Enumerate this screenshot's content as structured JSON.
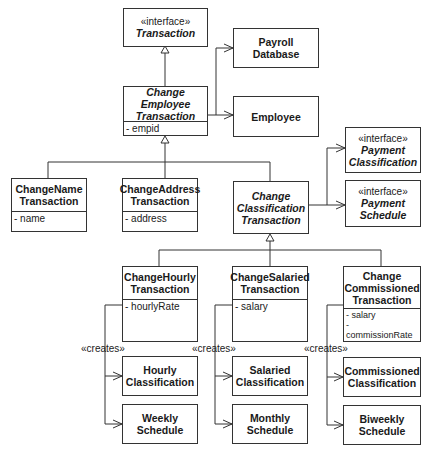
{
  "diagram": {
    "type": "UML class diagram",
    "classes": {
      "transaction": {
        "stereotype": "«interface»",
        "name": "Transaction"
      },
      "change_employee": {
        "line1": "Change",
        "line2": "Employee",
        "line3": "Transaction",
        "attrs": [
          "- empid"
        ]
      },
      "payroll_database": {
        "line1": "Payroll",
        "line2": "Database"
      },
      "employee": {
        "line1": "Employee"
      },
      "change_name": {
        "line1": "ChangeName",
        "line2": "Transaction",
        "attrs": [
          "- name"
        ]
      },
      "change_address": {
        "line1": "ChangeAddress",
        "line2": "Transaction",
        "attrs": [
          "- address"
        ]
      },
      "change_classification": {
        "line1": "Change",
        "line2": "Classification",
        "line3": "Transaction"
      },
      "payment_classification": {
        "stereotype": "«interface»",
        "line1": "Payment",
        "line2": "Classification"
      },
      "payment_schedule": {
        "stereotype": "«interface»",
        "line1": "Payment",
        "line2": "Schedule"
      },
      "change_hourly": {
        "line1": "ChangeHourly",
        "line2": "Transaction",
        "attrs": [
          "- hourlyRate"
        ]
      },
      "change_salaried": {
        "line1": "ChangeSalaried",
        "line2": "Transaction",
        "attrs": [
          "- salary"
        ]
      },
      "change_commissioned": {
        "line1": "Change",
        "line2": "Commissioned",
        "line3": "Transaction",
        "attrs": [
          "- salary",
          "- commissionRate"
        ]
      },
      "hourly_classification": {
        "line1": "Hourly",
        "line2": "Classification"
      },
      "weekly_schedule": {
        "line1": "Weekly",
        "line2": "Schedule"
      },
      "salaried_classification": {
        "line1": "Salaried",
        "line2": "Classification"
      },
      "monthly_schedule": {
        "line1": "Monthly",
        "line2": "Schedule"
      },
      "commissioned_classification": {
        "line1": "Commissioned",
        "line2": "Classification"
      },
      "biweekly_schedule": {
        "line1": "Biweekly",
        "line2": "Schedule"
      }
    },
    "labels": {
      "creates_hourly": "«creates»",
      "creates_salaried": "«creates»",
      "creates_commissioned": "«creates»"
    },
    "relationships": [
      {
        "from": "ChangeEmployeeTransaction",
        "to": "Transaction",
        "kind": "realization/generalization"
      },
      {
        "from": "ChangeEmployeeTransaction",
        "to": "PayrollDatabase",
        "kind": "association"
      },
      {
        "from": "ChangeEmployeeTransaction",
        "to": "Employee",
        "kind": "association"
      },
      {
        "from": "ChangeNameTransaction",
        "to": "ChangeEmployeeTransaction",
        "kind": "generalization"
      },
      {
        "from": "ChangeAddressTransaction",
        "to": "ChangeEmployeeTransaction",
        "kind": "generalization"
      },
      {
        "from": "ChangeClassificationTransaction",
        "to": "ChangeEmployeeTransaction",
        "kind": "generalization"
      },
      {
        "from": "ChangeClassificationTransaction",
        "to": "PaymentClassification",
        "kind": "association"
      },
      {
        "from": "ChangeClassificationTransaction",
        "to": "PaymentSchedule",
        "kind": "association"
      },
      {
        "from": "ChangeHourlyTransaction",
        "to": "ChangeClassificationTransaction",
        "kind": "generalization"
      },
      {
        "from": "ChangeSalariedTransaction",
        "to": "ChangeClassificationTransaction",
        "kind": "generalization"
      },
      {
        "from": "ChangeCommissionedTransaction",
        "to": "ChangeClassificationTransaction",
        "kind": "generalization"
      },
      {
        "from": "ChangeHourlyTransaction",
        "to": "HourlyClassification",
        "kind": "creates"
      },
      {
        "from": "ChangeHourlyTransaction",
        "to": "WeeklySchedule",
        "kind": "creates"
      },
      {
        "from": "ChangeSalariedTransaction",
        "to": "SalariedClassification",
        "kind": "creates"
      },
      {
        "from": "ChangeSalariedTransaction",
        "to": "MonthlySchedule",
        "kind": "creates"
      },
      {
        "from": "ChangeCommissionedTransaction",
        "to": "CommissionedClassification",
        "kind": "creates"
      },
      {
        "from": "ChangeCommissionedTransaction",
        "to": "BiweeklySchedule",
        "kind": "creates"
      }
    ]
  }
}
